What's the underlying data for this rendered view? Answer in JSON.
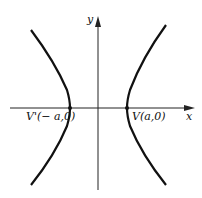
{
  "diagram": {
    "type": "hyperbola",
    "axes": {
      "x_label": "x",
      "y_label": "y"
    },
    "vertices": [
      {
        "name": "V'",
        "label": "V'(− a,0)"
      },
      {
        "name": "V",
        "label": "V(a,0)"
      }
    ],
    "colors": {
      "curve": "#111111",
      "axis": "#222222",
      "background": "#ffffff"
    }
  }
}
